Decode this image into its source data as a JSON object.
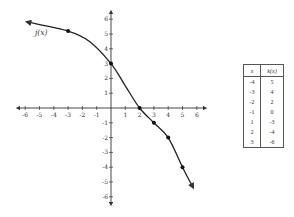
{
  "chart_data": [
    {
      "type": "line",
      "title": "",
      "series": [
        {
          "name": "j(x)",
          "label": "j(x)",
          "marked_points": [
            {
              "x": -3,
              "y": 5.2
            },
            {
              "x": 0,
              "y": 3
            },
            {
              "x": 2,
              "y": 0
            },
            {
              "x": 3,
              "y": -1
            },
            {
              "x": 4,
              "y": -2
            },
            {
              "x": 5,
              "y": -4
            }
          ],
          "curve": [
            {
              "x": -5.8,
              "y": 5.8
            },
            {
              "x": -3,
              "y": 5.2
            },
            {
              "x": -1.5,
              "y": 4.5
            },
            {
              "x": 0,
              "y": 3
            },
            {
              "x": 1,
              "y": 1.5
            },
            {
              "x": 2,
              "y": 0
            },
            {
              "x": 3,
              "y": -1
            },
            {
              "x": 4,
              "y": -2
            },
            {
              "x": 5,
              "y": -4
            },
            {
              "x": 5.7,
              "y": -5.3
            }
          ],
          "arrows": "both ends"
        }
      ],
      "xlabel": "",
      "ylabel": "",
      "xlim": [
        -6.5,
        6.5
      ],
      "ylim": [
        -6.5,
        6.5
      ],
      "x_ticks": [
        "-6",
        "-5",
        "-4",
        "-3",
        "-2",
        "-1",
        "1",
        "2",
        "3",
        "4",
        "5",
        "6"
      ],
      "y_ticks": [
        "6",
        "5",
        "4",
        "3",
        "2",
        "1",
        "-1",
        "-2",
        "-3",
        "-4",
        "-5",
        "-6"
      ],
      "grid": false,
      "legend": "none"
    },
    {
      "type": "table",
      "columns": [
        "x",
        "k(x)"
      ],
      "rows": [
        [
          "-4",
          "5"
        ],
        [
          "-3",
          "4"
        ],
        [
          "-2",
          "2"
        ],
        [
          "-1",
          "0"
        ],
        [
          "1",
          "-3"
        ],
        [
          "2",
          "-4"
        ],
        [
          "3",
          "-6"
        ]
      ]
    }
  ],
  "graph": {
    "function_label": "j(x)",
    "x_tick_labels": [
      "-6",
      "-5",
      "-4",
      "-3",
      "-2",
      "-1",
      "1",
      "2",
      "3",
      "4",
      "5",
      "6"
    ],
    "y_tick_labels": [
      "6",
      "5",
      "4",
      "3",
      "2",
      "1",
      "-1",
      "-2",
      "-3",
      "-4",
      "-5",
      "-6"
    ]
  },
  "table": {
    "headers": [
      "x",
      "k(x)"
    ],
    "rows": [
      [
        "-4",
        "5"
      ],
      [
        "-3",
        "4"
      ],
      [
        "-2",
        "2"
      ],
      [
        "-1",
        "0"
      ],
      [
        "1",
        "-3"
      ],
      [
        "2",
        "-4"
      ],
      [
        "3",
        "-6"
      ]
    ]
  },
  "colors": {
    "curve": "#222222",
    "axis": "#333333",
    "text": "#333333"
  }
}
